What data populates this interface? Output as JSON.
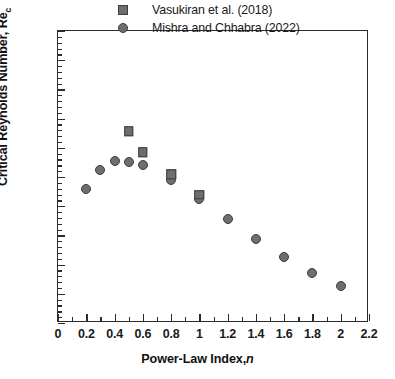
{
  "chart_data": {
    "type": "scatter",
    "title": "",
    "xlabel": "Power-Law Index, n",
    "xlabel_main": "Power-Law Index,",
    "xlabel_italic": "n",
    "ylabel": "Critical Reynolds Number, Re_c",
    "ylabel_main": "Critical Reynolds Number, Re",
    "ylabel_sub": "c",
    "xlim": [
      0,
      2.2
    ],
    "ylim": [
      0,
      50
    ],
    "xticks": [
      0,
      0.2,
      0.4,
      0.6,
      0.8,
      1,
      1.2,
      1.4,
      1.6,
      1.8,
      2,
      2.2
    ],
    "xtick_labels": [
      "0",
      "0.2",
      "0.4",
      "0.6",
      "0.8",
      "1",
      "1.2",
      "1.4",
      "1.6",
      "1.8",
      "2",
      "2.2"
    ],
    "xtick_minor_step": 0.1,
    "yticks": [
      0,
      5,
      10,
      15,
      20,
      25,
      30,
      35,
      40,
      45,
      50
    ],
    "ytick_labels": [
      "0",
      "5",
      "10",
      "15",
      "20",
      "25",
      "30",
      "35",
      "40",
      "45",
      "50"
    ],
    "ytick_minor_step": 1,
    "grid": false,
    "legend_position": "top-center",
    "marker_fill_color": "#6e6e6e",
    "marker_edge_color": "#3d3d3d",
    "axis_color": "#2b2b2b",
    "series": [
      {
        "name": "Vasukiran et al. (2018)",
        "marker": "square",
        "points": [
          {
            "x": 0.5,
            "y": 32.8
          },
          {
            "x": 0.6,
            "y": 29.2
          },
          {
            "x": 0.8,
            "y": 25.5
          },
          {
            "x": 1.0,
            "y": 22.0
          }
        ]
      },
      {
        "name": "Mishra and Chhabra (2022)",
        "marker": "circle",
        "points": [
          {
            "x": 0.2,
            "y": 23.0
          },
          {
            "x": 0.3,
            "y": 26.2
          },
          {
            "x": 0.4,
            "y": 27.7
          },
          {
            "x": 0.5,
            "y": 27.6
          },
          {
            "x": 0.6,
            "y": 27.1
          },
          {
            "x": 0.8,
            "y": 24.5
          },
          {
            "x": 1.0,
            "y": 21.3
          },
          {
            "x": 1.2,
            "y": 17.8
          },
          {
            "x": 1.4,
            "y": 14.4
          },
          {
            "x": 1.6,
            "y": 11.3
          },
          {
            "x": 1.8,
            "y": 8.6
          },
          {
            "x": 2.0,
            "y": 6.3
          }
        ]
      }
    ]
  }
}
